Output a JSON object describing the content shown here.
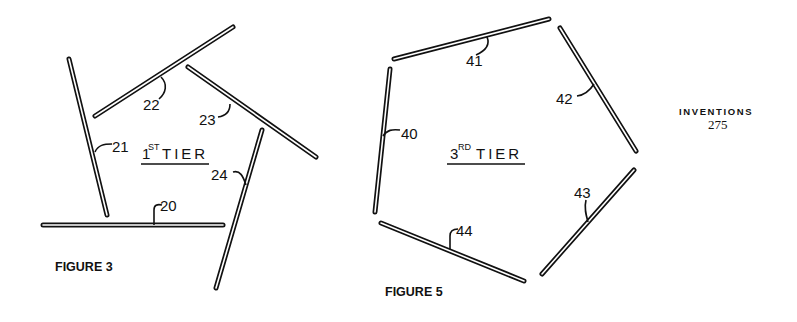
{
  "header": {
    "title": "INVENTIONS",
    "page_number": "275"
  },
  "figure3": {
    "caption": "FIGURE 3",
    "tier_numeral": "1",
    "tier_superscript": "ST",
    "tier_word": "TIER",
    "parts": [
      {
        "id": "20",
        "label": "20"
      },
      {
        "id": "21",
        "label": "21"
      },
      {
        "id": "22",
        "label": "22"
      },
      {
        "id": "23",
        "label": "23"
      },
      {
        "id": "24",
        "label": "24"
      }
    ]
  },
  "figure5": {
    "caption": "FIGURE 5",
    "tier_numeral": "3",
    "tier_superscript": "RD",
    "tier_word": "TIER",
    "parts": [
      {
        "id": "40",
        "label": "40"
      },
      {
        "id": "41",
        "label": "41"
      },
      {
        "id": "42",
        "label": "42"
      },
      {
        "id": "43",
        "label": "43"
      },
      {
        "id": "44",
        "label": "44"
      }
    ]
  }
}
